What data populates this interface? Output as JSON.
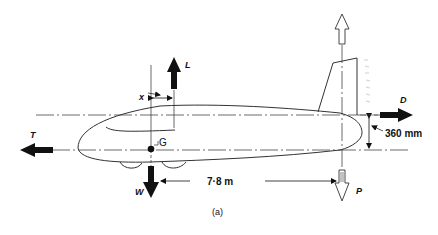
{
  "figure": {
    "caption": "(a)"
  },
  "forces": {
    "lift": {
      "label": "L",
      "direction": "up",
      "style": "solid"
    },
    "weight": {
      "label": "W",
      "direction": "down",
      "style": "solid"
    },
    "thrust": {
      "label": "T",
      "direction": "left",
      "style": "solid"
    },
    "drag": {
      "label": "D",
      "direction": "right",
      "style": "solid"
    },
    "tail_load_up": {
      "direction": "up",
      "style": "outline"
    },
    "tail_load_p": {
      "label": "P",
      "direction": "down",
      "style": "outline"
    }
  },
  "points": {
    "cg": {
      "label": "G"
    }
  },
  "dimensions": {
    "lift_offset": {
      "label": "x"
    },
    "tail_arm": {
      "label": "7·8 m"
    },
    "drag_offset": {
      "label": "360 mm"
    }
  },
  "colors": {
    "ink": "#111111",
    "line": "#333333",
    "background": "#ffffff"
  }
}
